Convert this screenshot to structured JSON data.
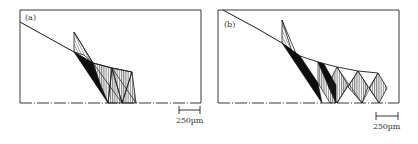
{
  "figure": {
    "panels": [
      {
        "id": "a",
        "label": "(a)",
        "scale_bar": {
          "label": "250µm"
        }
      },
      {
        "id": "b",
        "label": "(b)",
        "scale_bar": {
          "label": "250µm"
        }
      }
    ],
    "colors": {
      "line": "#1a1a1a",
      "fill_solid": "#0d0d0d",
      "background": "#ffffff"
    }
  }
}
